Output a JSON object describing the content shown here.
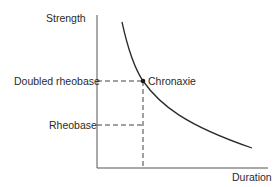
{
  "diagram": {
    "y_axis_label": "Strength",
    "x_axis_label": "Duration",
    "levels": {
      "doubled_rheobase": "Doubled rheobase",
      "rheobase": "Rheobase"
    },
    "point_label": "Chronaxie",
    "colors": {
      "line": "#2a2a2a",
      "axis": "#555555",
      "dash": "#444444"
    }
  }
}
